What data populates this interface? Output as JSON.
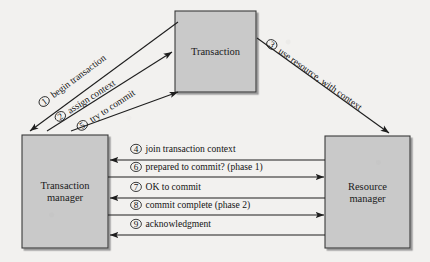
{
  "figure": {
    "type": "sequence-interaction-diagram",
    "background_color": "#f2f1ef",
    "box_fill_color": "#c9c9c9",
    "box_border_color": "#3a3a3a",
    "line_color": "#1e1e1e"
  },
  "nodes": [
    {
      "id": "transaction",
      "name": "transaction-box",
      "label_lines": [
        "Transaction"
      ],
      "x": 175,
      "y": 11,
      "w": 81,
      "h": 81
    },
    {
      "id": "transaction_manager",
      "name": "transaction-manager-box",
      "label_lines": [
        "Transaction",
        "manager"
      ],
      "x": 22,
      "y": 135,
      "w": 86,
      "h": 113
    },
    {
      "id": "resource_manager",
      "name": "resource-manager-box",
      "label_lines": [
        "Resource",
        "manager"
      ],
      "x": 325,
      "y": 136,
      "w": 85,
      "h": 112
    }
  ],
  "edges": [
    {
      "number": "1",
      "marker": "①",
      "label": "begin transaction",
      "from": "transaction",
      "to": "transaction_manager",
      "orientation": "diagonal-down-left",
      "x1": 178,
      "y1": 22,
      "x2": 30,
      "y2": 131,
      "label_x": 46,
      "label_y": 104,
      "rotate": -36.5
    },
    {
      "number": "2",
      "marker": "②",
      "label": "assign context",
      "from": "transaction_manager",
      "to": "transaction",
      "orientation": "diagonal-up-right",
      "x1": 47,
      "y1": 131,
      "x2": 172,
      "y2": 52,
      "label_x": 62,
      "label_y": 119,
      "rotate": -32.5
    },
    {
      "number": "5",
      "marker": "⑤",
      "label": "try to commit",
      "from": "transaction_manager",
      "to": "transaction",
      "orientation": "diagonal-up-right",
      "x1": 71,
      "y1": 131,
      "x2": 178,
      "y2": 92,
      "label_x": 84,
      "label_y": 128,
      "rotate": -33
    },
    {
      "number": "3",
      "marker": "③",
      "label": "use resource, with context",
      "from": "transaction",
      "to": "resource_manager",
      "orientation": "diagonal-down-right",
      "x1": 257,
      "y1": 38,
      "x2": 389,
      "y2": 133,
      "label_x": 270,
      "label_y": 47,
      "rotate": 35.5
    },
    {
      "number": "4",
      "marker": "④",
      "label": "join transaction context",
      "from": "resource_manager",
      "to": "transaction_manager",
      "orientation": "horizontal-left",
      "y": 160,
      "x1": 325,
      "x2": 110,
      "label_x": 136,
      "label_y": 152
    },
    {
      "number": "6",
      "marker": "⑥",
      "label": "prepared to commit? (phase 1)",
      "from": "transaction_manager",
      "to": "resource_manager",
      "orientation": "horizontal-right",
      "y": 177,
      "x1": 108,
      "x2": 324,
      "label_x": 136,
      "label_y": 170
    },
    {
      "number": "7",
      "marker": "⑦",
      "label": "OK to commit",
      "from": "resource_manager",
      "to": "transaction_manager",
      "orientation": "horizontal-left",
      "y": 198,
      "x1": 325,
      "x2": 110,
      "label_x": 136,
      "label_y": 190
    },
    {
      "number": "8",
      "marker": "⑧",
      "label": "commit complete (phase 2)",
      "from": "transaction_manager",
      "to": "resource_manager",
      "orientation": "horizontal-right",
      "y": 215,
      "x1": 108,
      "x2": 324,
      "label_x": 136,
      "label_y": 208
    },
    {
      "number": "9",
      "marker": "⑨",
      "label": "acknowledgment",
      "from": "resource_manager",
      "to": "transaction_manager",
      "orientation": "horizontal-left",
      "y": 235,
      "x1": 325,
      "x2": 110,
      "label_x": 136,
      "label_y": 227
    }
  ]
}
